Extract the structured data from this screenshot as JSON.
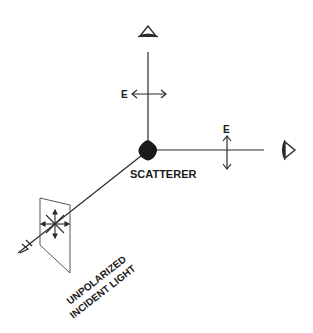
{
  "diagram": {
    "type": "light-scattering-polarization",
    "labels": {
      "top_field": "E",
      "side_field": "E",
      "scatterer": "SCATTERER",
      "incident_line1": "UNPOLARIZED",
      "incident_line2": "INCIDENT LIGHT"
    },
    "elements": [
      {
        "name": "incident-beam",
        "description": "unpolarized light entering from lower-left"
      },
      {
        "name": "polarizer-plate",
        "description": "plate showing unpolarized E-field star"
      },
      {
        "name": "scatterer",
        "description": "dark blob at origin"
      },
      {
        "name": "vertical-observer",
        "description": "eye at top, sees horizontally polarized E"
      },
      {
        "name": "horizontal-observer",
        "description": "eye at right, sees vertically polarized E"
      }
    ],
    "colors": {
      "ink": "#2a2a2a",
      "background": "#ffffff"
    }
  }
}
